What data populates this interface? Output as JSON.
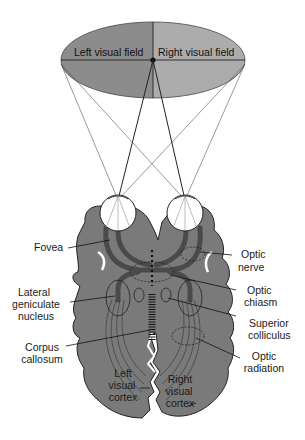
{
  "diagram": {
    "type": "anatomical",
    "visual_field": {
      "left_label": "Left visual field",
      "right_label": "Right visual field",
      "colors": {
        "left": "#8c8c8c",
        "right": "#acacac"
      }
    },
    "labels": {
      "fovea": "Fovea",
      "optic_nerve": [
        "Optic",
        "nerve"
      ],
      "lateral_geniculate": [
        "Lateral",
        "geniculate",
        "nucleus"
      ],
      "optic_chiasm": [
        "Optic",
        "chiasm"
      ],
      "superior_colliculus": [
        "Superior",
        "colliculus"
      ],
      "corpus_callosum": [
        "Corpus",
        "callosum"
      ],
      "optic_radiation": [
        "Optic",
        "radiation"
      ],
      "left_visual_cortex": [
        "Left",
        "visual",
        "cortex"
      ],
      "right_visual_cortex": [
        "Right",
        "visual",
        "cortex"
      ]
    },
    "colors": {
      "brain": "#7a7a7a",
      "pathway": "#4a4a4a",
      "outline": "#222222",
      "eye": "#ffffff"
    }
  }
}
